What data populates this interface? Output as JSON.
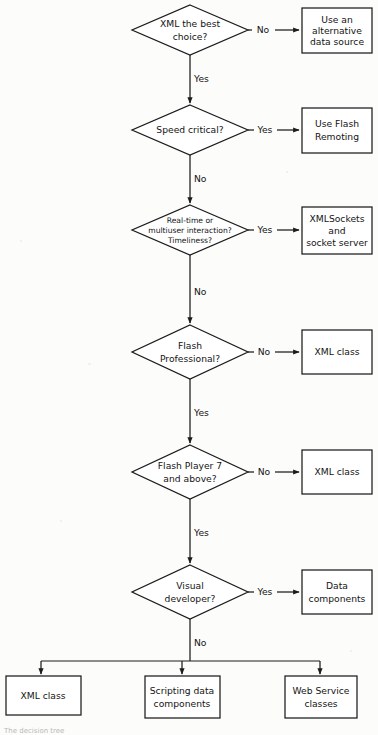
{
  "figure": {
    "caption_partial": "The decision tree"
  },
  "colors": {
    "stroke": "#1c1c1c",
    "page_background": "#fcfcfb",
    "shape_fill": "#ffffff",
    "text": "#141414"
  },
  "decisions": [
    {
      "id": "xml-best-choice",
      "lines": [
        "XML the best",
        "choice?"
      ],
      "yes_label": "Yes",
      "no_label": "No",
      "branch_side": "no"
    },
    {
      "id": "speed-critical",
      "lines": [
        "Speed critical?"
      ],
      "yes_label": "Yes",
      "no_label": "No",
      "branch_side": "yes"
    },
    {
      "id": "realtime-multiuser",
      "lines": [
        "Real-time or",
        "multiuser interaction?",
        "Timeliness?"
      ],
      "yes_label": "Yes",
      "no_label": "No",
      "branch_side": "yes"
    },
    {
      "id": "flash-professional",
      "lines": [
        "Flash",
        "Professional?"
      ],
      "yes_label": "Yes",
      "no_label": "No",
      "branch_side": "no"
    },
    {
      "id": "flash-player-7",
      "lines": [
        "Flash Player 7",
        "and above?"
      ],
      "yes_label": "Yes",
      "no_label": "No",
      "branch_side": "no"
    },
    {
      "id": "visual-developer",
      "lines": [
        "Visual",
        "developer?"
      ],
      "yes_label": "Yes",
      "no_label": "No",
      "branch_side": "yes"
    }
  ],
  "outcomes_right": [
    {
      "id": "alternative-data-source",
      "lines": [
        "Use an",
        "alternative",
        "data source"
      ]
    },
    {
      "id": "flash-remoting",
      "lines": [
        "Use Flash",
        "Remoting"
      ]
    },
    {
      "id": "xmlsockets",
      "lines": [
        "XMLSockets",
        "and",
        "socket server"
      ]
    },
    {
      "id": "xml-class-1",
      "lines": [
        "XML class"
      ]
    },
    {
      "id": "xml-class-2",
      "lines": [
        "XML class"
      ]
    },
    {
      "id": "data-components",
      "lines": [
        "Data",
        "components"
      ]
    }
  ],
  "outcomes_bottom": [
    {
      "id": "xml-class-3",
      "lines": [
        "XML class"
      ]
    },
    {
      "id": "scripting-data-components",
      "lines": [
        "Scripting data",
        "components"
      ]
    },
    {
      "id": "web-service-classes",
      "lines": [
        "Web Service",
        "classes"
      ]
    }
  ],
  "edge_labels": {
    "no": "No",
    "yes": "Yes"
  }
}
